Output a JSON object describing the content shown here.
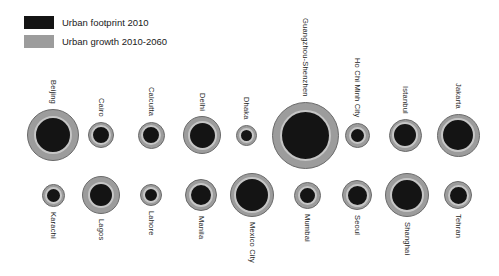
{
  "page": {
    "background": "#ffffff",
    "width_px": 499,
    "height_px": 276
  },
  "chart_data": {
    "type": "bubble",
    "title": "",
    "encoding_note": "inner black circle = urban footprint 2010, outer gray ring = urban growth 2010-2060; circle size encodes urban extent",
    "legend": [
      {
        "label": "Urban footprint 2010",
        "color": "#141414"
      },
      {
        "label": "Urban growth 2010-2060",
        "color": "#9c9c9c"
      }
    ],
    "colors": {
      "growth_ring": "#9c9c9c",
      "growth_ring_outline": "#6a6a6a",
      "footprint_core": "#141414",
      "inner_light_ring": "#c6c6c6"
    },
    "rows": {
      "top_cy": 135,
      "bottom_cy": 195
    },
    "cities": [
      {
        "name": "Beijing",
        "row": "top",
        "cx": 53,
        "footprint_d_px": 34,
        "growth_d_px": 52
      },
      {
        "name": "Cairo",
        "row": "top",
        "cx": 101,
        "footprint_d_px": 16,
        "growth_d_px": 26
      },
      {
        "name": "Calcutta",
        "row": "top",
        "cx": 151,
        "footprint_d_px": 16,
        "growth_d_px": 27
      },
      {
        "name": "Delhi",
        "row": "top",
        "cx": 202,
        "footprint_d_px": 25,
        "growth_d_px": 38
      },
      {
        "name": "Dhaka",
        "row": "top",
        "cx": 246,
        "footprint_d_px": 11,
        "growth_d_px": 21
      },
      {
        "name": "Guangzhou-Shenzhen",
        "row": "top",
        "cx": 305,
        "footprint_d_px": 47,
        "growth_d_px": 67
      },
      {
        "name": "Ho Chi Minh City",
        "row": "top",
        "cx": 357,
        "footprint_d_px": 13,
        "growth_d_px": 25
      },
      {
        "name": "Istanbul",
        "row": "top",
        "cx": 405,
        "footprint_d_px": 22,
        "growth_d_px": 33
      },
      {
        "name": "Jakarta",
        "row": "top",
        "cx": 458,
        "footprint_d_px": 30,
        "growth_d_px": 43
      },
      {
        "name": "Karachi",
        "row": "bottom",
        "cx": 53,
        "footprint_d_px": 13,
        "growth_d_px": 23
      },
      {
        "name": "Lagos",
        "row": "bottom",
        "cx": 101,
        "footprint_d_px": 22,
        "growth_d_px": 38
      },
      {
        "name": "Lahore",
        "row": "bottom",
        "cx": 151,
        "footprint_d_px": 12,
        "growth_d_px": 22
      },
      {
        "name": "Manila",
        "row": "bottom",
        "cx": 201,
        "footprint_d_px": 20,
        "growth_d_px": 32
      },
      {
        "name": "Mexico City",
        "row": "bottom",
        "cx": 252,
        "footprint_d_px": 32,
        "growth_d_px": 44
      },
      {
        "name": "Mumbai",
        "row": "bottom",
        "cx": 307,
        "footprint_d_px": 15,
        "growth_d_px": 27
      },
      {
        "name": "Seoul",
        "row": "bottom",
        "cx": 357,
        "footprint_d_px": 19,
        "growth_d_px": 30
      },
      {
        "name": "Shanghai",
        "row": "bottom",
        "cx": 407,
        "footprint_d_px": 30,
        "growth_d_px": 44
      },
      {
        "name": "Tehran",
        "row": "bottom",
        "cx": 458,
        "footprint_d_px": 17,
        "growth_d_px": 28
      }
    ]
  }
}
